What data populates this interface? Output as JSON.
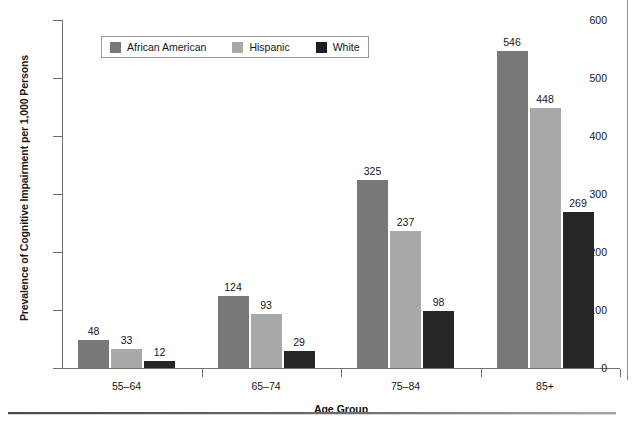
{
  "chart_data": {
    "type": "bar",
    "title": "",
    "xlabel": "Age Group",
    "ylabel": "Prevalence of Cognitive Impairment per 1,000 Persons",
    "categories": [
      "55–64",
      "65–74",
      "75–84",
      "85+"
    ],
    "series": [
      {
        "name": "African American",
        "color": "#787878",
        "values": [
          48,
          124,
          325,
          546
        ]
      },
      {
        "name": "Hispanic",
        "color": "#a9a9a9",
        "values": [
          33,
          93,
          237,
          448
        ]
      },
      {
        "name": "White",
        "color": "#262626",
        "values": [
          12,
          29,
          98,
          269
        ]
      }
    ],
    "ylim": [
      0,
      600
    ],
    "yticks": [
      0,
      100,
      200,
      300,
      400,
      500,
      600
    ],
    "ytick_labels": [
      "0",
      "100",
      "200",
      "300",
      "400",
      "500",
      "600"
    ],
    "grid": false,
    "legend_position": "top-left-inside",
    "data_labels": true
  },
  "legend": {
    "items": [
      {
        "label": "African American",
        "swatch": "legend-swatch-african-american"
      },
      {
        "label": "Hispanic",
        "swatch": "legend-swatch-hispanic"
      },
      {
        "label": "White",
        "swatch": "legend-swatch-white"
      }
    ]
  }
}
